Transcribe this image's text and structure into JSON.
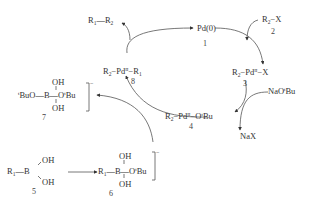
{
  "diagram": {
    "colors": {
      "ink": "#333333",
      "background": "#ffffff"
    },
    "species": {
      "pd0": {
        "label": "Pd(0)",
        "number": "1"
      },
      "r2x": {
        "r": "R",
        "r_sub": "2",
        "rest": "−X",
        "number": "2"
      },
      "pd_r2_x": {
        "r": "R",
        "r_sub": "2",
        "pd": "−Pd",
        "ox": "II",
        "rest": "−X",
        "number": "3"
      },
      "pd_r2_otbu": {
        "r": "R",
        "r_sub": "2",
        "pd": "−Pd",
        "ox": "II",
        "rest": "−O",
        "t": "t",
        "bu": "Bu",
        "number": "4"
      },
      "boronic_acid": {
        "r": "R",
        "r_sub": "1",
        "bond": "—B",
        "oh_top": "OH",
        "oh_bottom": "OH",
        "number": "5"
      },
      "borate_6": {
        "r": "R",
        "r_sub": "1",
        "b": "—B—O",
        "t": "t",
        "bu": "Bu",
        "oh_top": "OH",
        "oh_bottom": "OH",
        "charge": "−",
        "number": "6"
      },
      "borate_7": {
        "left_t": "t",
        "left": "BuO—B—O",
        "t": "t",
        "bu": "Bu",
        "oh_top": "OH",
        "oh_bottom": "OH",
        "charge": "−",
        "number": "7"
      },
      "pd_r2_r1": {
        "r2": "R",
        "r2_sub": "2",
        "pd": "−Pd",
        "ox": "II",
        "r1": "−R",
        "r1_sub": "1",
        "number": "8"
      },
      "product": {
        "r1": "R",
        "r1_sub": "1",
        "bond": "—R",
        "r2_sub": "2"
      },
      "base": {
        "label": "NaO",
        "t": "t",
        "bu": "Bu"
      },
      "salt": {
        "label": "NaX"
      }
    }
  }
}
